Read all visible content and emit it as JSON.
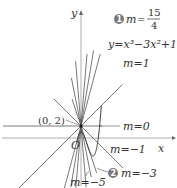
{
  "axes": {
    "x_label": "x",
    "y_label": "y",
    "origin_label": "O"
  },
  "point": {
    "label": "(0, 2)",
    "x": 0,
    "y": 2
  },
  "curve": {
    "label": "y=x³−3x²+1",
    "equation": "y = x^3 - 3x^2 + 1"
  },
  "lines": [
    {
      "slope": 3.75,
      "label": "m=15/4",
      "badge": "1"
    },
    {
      "slope": 1,
      "label": "m=1"
    },
    {
      "slope": 0,
      "label": "m=0"
    },
    {
      "slope": -1,
      "label": "m=−1"
    },
    {
      "slope": -3,
      "label": "m=−3",
      "badge": "2"
    },
    {
      "slope": -5,
      "label": "m=−5"
    }
  ],
  "extra_lines": [
    {
      "slope": 12
    },
    {
      "slope": -12
    },
    {
      "slope": 6
    }
  ],
  "labels": {
    "m_15_4_prefix": "m",
    "m_15_4_eq": "=",
    "m_15_4_num": "15",
    "m_15_4_den": "4",
    "badge1": "1",
    "badge2": "2",
    "curve": "y=x³−3x²+1",
    "m1": "m=1",
    "m0": "m=0",
    "mneg1": "m=−1",
    "mneg3": "m=−3",
    "mneg5": "m=−5",
    "point": "(0, 2)"
  },
  "colors": {
    "line": "#555555",
    "axis": "#888888",
    "badge": "#777777",
    "text": "#333333"
  }
}
